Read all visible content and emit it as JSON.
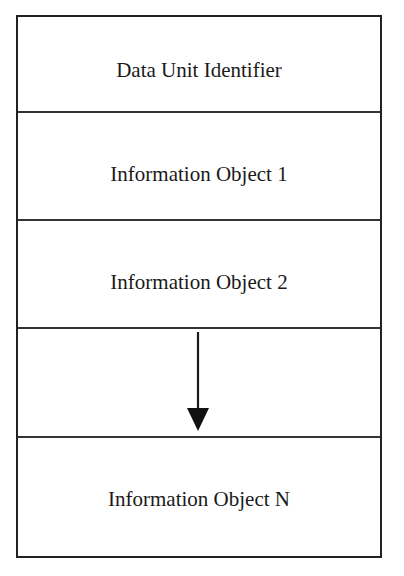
{
  "diagram": {
    "type": "stacked-structure",
    "rows": [
      {
        "label": "Data Unit Identifier"
      },
      {
        "label": "Information Object 1"
      },
      {
        "label": "Information Object 2"
      },
      {
        "label": ""
      },
      {
        "label": "Information Object N"
      }
    ],
    "continuation_arrow": {
      "direction": "down",
      "meaning": "continuation"
    },
    "colors": {
      "line": "#222222",
      "text": "#1a1a1a",
      "background": "#ffffff"
    }
  }
}
